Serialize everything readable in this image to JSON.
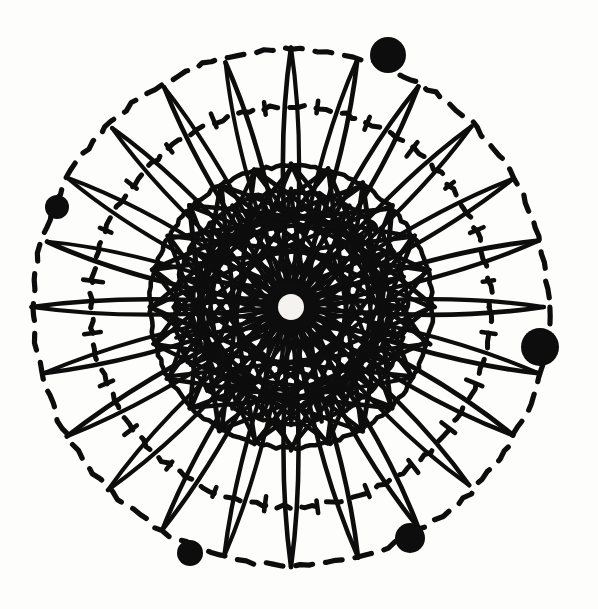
{
  "figure": {
    "style": "ink-woodcut",
    "background_color": "#fdfdfc",
    "ink_color": "#0d0d0d",
    "canvas": {
      "width": 598,
      "height": 609
    }
  },
  "geometry": {
    "center": {
      "x": 291,
      "y": 307
    },
    "hub": {
      "radius": 13,
      "fill": "#f4f3f0"
    },
    "divisions": 24,
    "angle_offset_deg": -90,
    "rings": [
      {
        "name": "outer-dashed-circle",
        "radius": 258,
        "style": "dashed",
        "stroke_width": 5.2,
        "dash": "17 13"
      },
      {
        "name": "inner-dashed-circle",
        "radius": 200,
        "style": "dashed",
        "stroke_width": 5.0,
        "dash": "15 12"
      },
      {
        "name": "outer-solid-circle",
        "radius": 141,
        "style": "solid",
        "stroke_width": 4.6,
        "dash": ""
      },
      {
        "name": "middle-solid-circle",
        "radius": 116,
        "style": "solid",
        "stroke_width": 4.4,
        "dash": ""
      },
      {
        "name": "inner-solid-circle",
        "radius": 98,
        "style": "solid",
        "stroke_width": 4.2,
        "dash": ""
      }
    ],
    "petals": {
      "name": "radial-lens-petals",
      "count": 24,
      "inner_radius": 6,
      "outer_radius": 256,
      "half_width": 17,
      "bulge_radius": 150,
      "stroke_width": 4.4
    },
    "star_chords": [
      {
        "name": "star-chord-step-7",
        "points": 24,
        "step": 7,
        "radius": 141,
        "stroke_width": 4.6
      },
      {
        "name": "star-chord-step-9",
        "points": 24,
        "step": 9,
        "radius": 141,
        "stroke_width": 4.4
      },
      {
        "name": "star-chord-step-11",
        "points": 24,
        "step": 11,
        "radius": 116,
        "stroke_width": 4.0
      },
      {
        "name": "star-chord-step-5",
        "points": 24,
        "step": 5,
        "radius": 98,
        "stroke_width": 3.8
      }
    ],
    "tick_marks": {
      "name": "radial-tick-marks",
      "count": 24,
      "ring_radius": 200,
      "length": 15,
      "stroke_width": 4.6
    }
  },
  "nodes": [
    {
      "label": "node-top",
      "angle_deg": -68,
      "radius": 258,
      "dot_radius": 18,
      "cx": 388,
      "cy": 55
    },
    {
      "label": "node-right",
      "angle_deg": 9,
      "radius": 258,
      "dot_radius": 19,
      "cx": 540,
      "cy": 347
    },
    {
      "label": "node-left",
      "angle_deg": 202,
      "radius": 258,
      "dot_radius": 12,
      "cx": 57,
      "cy": 207
    },
    {
      "label": "node-bottom-left",
      "angle_deg": 112,
      "radius": 258,
      "dot_radius": 13,
      "cx": 190,
      "cy": 553
    },
    {
      "label": "node-bottom-right",
      "angle_deg": 60,
      "radius": 258,
      "dot_radius": 15,
      "cx": 410,
      "cy": 538
    }
  ],
  "chart_data": {
    "type": "scatter",
    "xlabel": "",
    "ylabel": "",
    "xlim": [
      0,
      598
    ],
    "ylim": [
      0,
      609
    ],
    "grid": false,
    "legend": "none",
    "series": [
      {
        "name": "marker-nodes",
        "x": [
          388,
          540,
          57,
          190,
          410
        ],
        "y": [
          55,
          347,
          207,
          553,
          538
        ],
        "sizes": [
          18,
          19,
          12,
          13,
          15
        ],
        "labels": [
          "node-top",
          "node-right",
          "node-left",
          "node-bottom-left",
          "node-bottom-right"
        ]
      }
    ],
    "annotations": [
      {
        "name": "hub",
        "x": 291,
        "y": 307,
        "radius": 13
      },
      {
        "name": "outer-dashed-circle",
        "x": 291,
        "y": 307,
        "radius": 258
      },
      {
        "name": "inner-dashed-circle",
        "x": 291,
        "y": 307,
        "radius": 200
      },
      {
        "name": "outer-solid-circle",
        "x": 291,
        "y": 307,
        "radius": 141
      },
      {
        "name": "middle-solid-circle",
        "x": 291,
        "y": 307,
        "radius": 116
      },
      {
        "name": "inner-solid-circle",
        "x": 291,
        "y": 307,
        "radius": 98
      }
    ]
  }
}
